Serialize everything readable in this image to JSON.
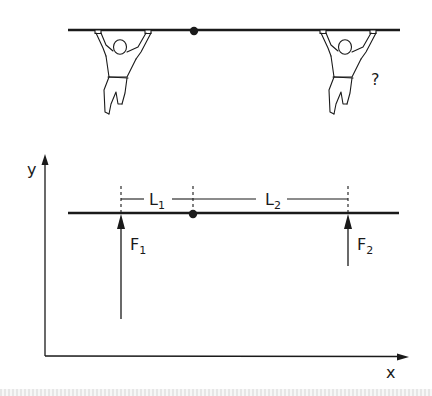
{
  "top_scene": {
    "description": "Two people hanging from a beam with a central pivot",
    "question_mark": "?"
  },
  "force_diagram": {
    "axes": {
      "x_label": "x",
      "y_label": "y"
    },
    "dimensions": [
      {
        "label": "L",
        "subscript": "1"
      },
      {
        "label": "L",
        "subscript": "2"
      }
    ],
    "forces": [
      {
        "label": "F",
        "subscript": "1"
      },
      {
        "label": "F",
        "subscript": "2"
      }
    ]
  },
  "colors": {
    "ink": "#1a1a1a",
    "background": "#ffffff"
  }
}
